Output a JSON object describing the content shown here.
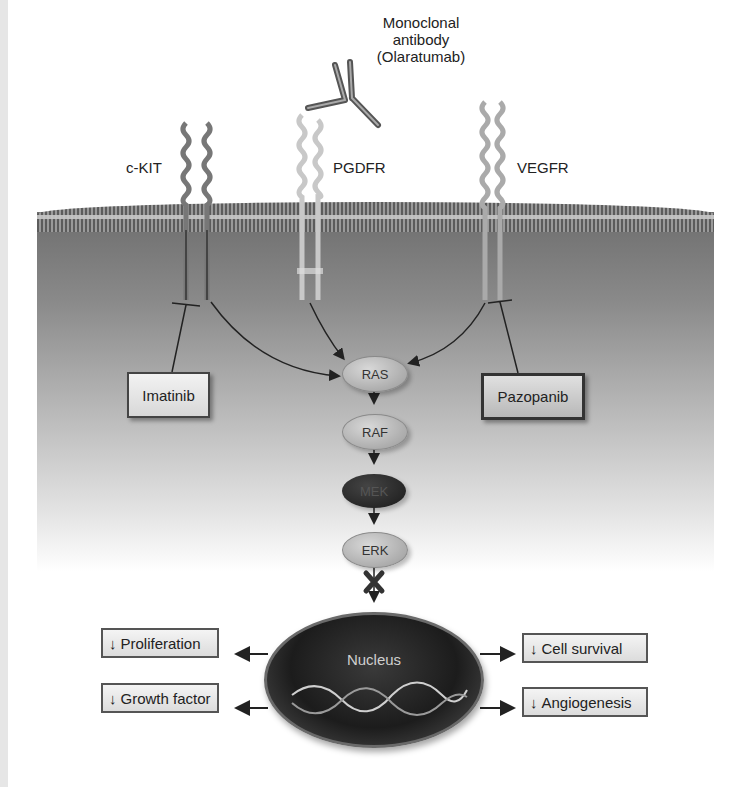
{
  "receptors": [
    {
      "name": "c-KIT"
    },
    {
      "name": "PGDFR"
    },
    {
      "name": "VEGFR"
    }
  ],
  "antibody": {
    "line1": "Monoclonal",
    "line2": "antibody",
    "line3": "(Olaratumab)"
  },
  "drugs": {
    "left": "Imatinib",
    "right": "Pazopanib"
  },
  "cascade": [
    "RAS",
    "RAF",
    "MEK",
    "ERK"
  ],
  "nucleus": {
    "label": "Nucleus"
  },
  "effects": {
    "left": [
      "Proliferation",
      "Growth factor"
    ],
    "right": [
      "Cell survival",
      "Angiogenesis"
    ],
    "down_glyph": "↓"
  },
  "colors": {
    "membrane": "#5c5c5c",
    "cytoplasm_top": "#6e6e6e",
    "nucleus": "#1c1c1c",
    "arrow": "#222222"
  }
}
